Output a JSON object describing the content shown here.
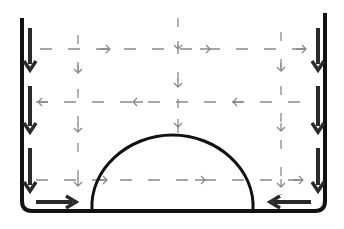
{
  "diagram": {
    "title": "",
    "colors": {
      "background": "#ffffff",
      "wall": "#111111",
      "thick_arrow": "#2a2a2a",
      "dashed_flow": "#8a8a8a",
      "dome": "#111111"
    },
    "vessel": {
      "left_wall_x": 22,
      "right_wall_x": 325,
      "left_wall_top_y": 18,
      "right_wall_top_y": 13,
      "bottom_y": 211,
      "corner_radius": 10
    },
    "dome": {
      "x_start": 92,
      "x_end": 253,
      "top_y": 135,
      "base_y": 211
    },
    "wall_arrows": [
      {
        "side": "left",
        "x": 30,
        "y1": 28,
        "y2": 70,
        "direction": "down"
      },
      {
        "side": "left",
        "x": 30,
        "y1": 86,
        "y2": 132,
        "direction": "down"
      },
      {
        "side": "left",
        "x": 30,
        "y1": 148,
        "y2": 191,
        "direction": "down"
      },
      {
        "side": "right",
        "x": 318,
        "y1": 28,
        "y2": 70,
        "direction": "down"
      },
      {
        "side": "right",
        "x": 318,
        "y1": 86,
        "y2": 132,
        "direction": "down"
      },
      {
        "side": "right",
        "x": 318,
        "y1": 148,
        "y2": 191,
        "direction": "down"
      }
    ],
    "bottom_arrows": [
      {
        "side": "left",
        "x1": 36,
        "x2": 76,
        "y": 202,
        "direction": "right"
      },
      {
        "side": "right",
        "x1": 311,
        "x2": 270,
        "y": 202,
        "direction": "left"
      }
    ],
    "flow_rows": [
      {
        "y": 49,
        "x1": 40,
        "x2": 308,
        "direction": "right",
        "arrow_x": [
          110,
          210,
          306
        ]
      },
      {
        "y": 102,
        "x1": 36,
        "x2": 308,
        "direction": "left",
        "arrow_x": [
          38,
          133,
          233
        ]
      },
      {
        "y": 180,
        "x1": 36,
        "x2": 308,
        "direction": "right",
        "arrow_x": [
          107,
          205,
          303
        ]
      }
    ],
    "flow_columns": [
      {
        "x": 78,
        "y1": 35,
        "y2": 195,
        "arrow_y": [
          73,
          132,
          186
        ]
      },
      {
        "x": 178,
        "y1": 18,
        "y2": 133,
        "arrow_y": [
          49,
          87,
          127
        ]
      },
      {
        "x": 281,
        "y1": 32,
        "y2": 195,
        "arrow_y": [
          71,
          131,
          187
        ]
      }
    ]
  }
}
